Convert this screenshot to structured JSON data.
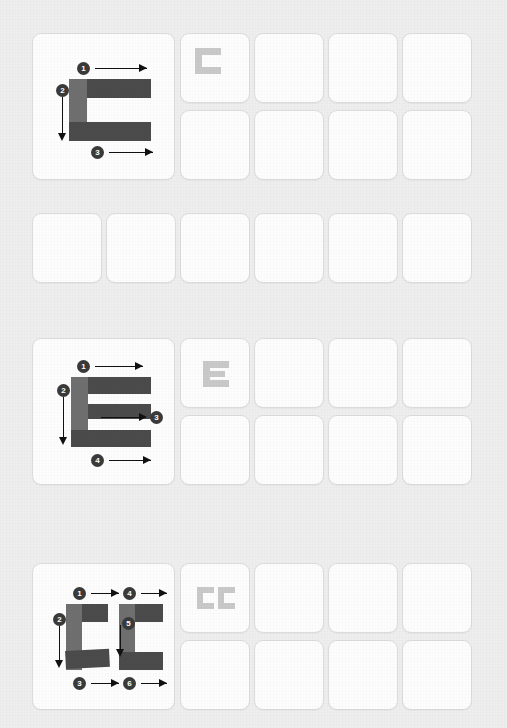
{
  "worksheet": {
    "title": "Letter stroke-order tracing worksheet",
    "background_color": "#eeeeee",
    "cell_color": "#fdfdfd",
    "cell_border_color": "#dcdcdc",
    "stroke_bar_color": "#4b4b4b",
    "stroke_stem_color": "#6f6f6f",
    "ghost_letter_color": "#c9c9c9",
    "badge_color": "#3a3a3a",
    "arrow_color": "#111111"
  },
  "sections": [
    {
      "letter": "C",
      "demo_label": "stroke-order-diagram-C",
      "stroke_count": 3,
      "strokes": [
        {
          "number": "1",
          "direction": "right"
        },
        {
          "number": "2",
          "direction": "down"
        },
        {
          "number": "3",
          "direction": "right"
        }
      ],
      "ghost_letter": "C",
      "practice_rows": 2,
      "practice_cols": 4,
      "has_extra_row": true,
      "extra_row_cells": 6
    },
    {
      "letter": "E",
      "demo_label": "stroke-order-diagram-E",
      "stroke_count": 4,
      "strokes": [
        {
          "number": "1",
          "direction": "right"
        },
        {
          "number": "2",
          "direction": "down"
        },
        {
          "number": "3",
          "direction": "right"
        },
        {
          "number": "4",
          "direction": "right"
        }
      ],
      "ghost_letter": "E",
      "practice_rows": 2,
      "practice_cols": 4,
      "has_extra_row": false,
      "extra_row_cells": 0
    },
    {
      "letter": "CC",
      "demo_label": "stroke-order-diagram-CC",
      "stroke_count": 6,
      "strokes": [
        {
          "number": "1",
          "direction": "right"
        },
        {
          "number": "2",
          "direction": "down"
        },
        {
          "number": "3",
          "direction": "right"
        },
        {
          "number": "4",
          "direction": "right"
        },
        {
          "number": "5",
          "direction": "down"
        },
        {
          "number": "6",
          "direction": "right"
        }
      ],
      "ghost_letter": "CC",
      "practice_rows": 2,
      "practice_cols": 4,
      "has_extra_row": false,
      "extra_row_cells": 0
    }
  ]
}
